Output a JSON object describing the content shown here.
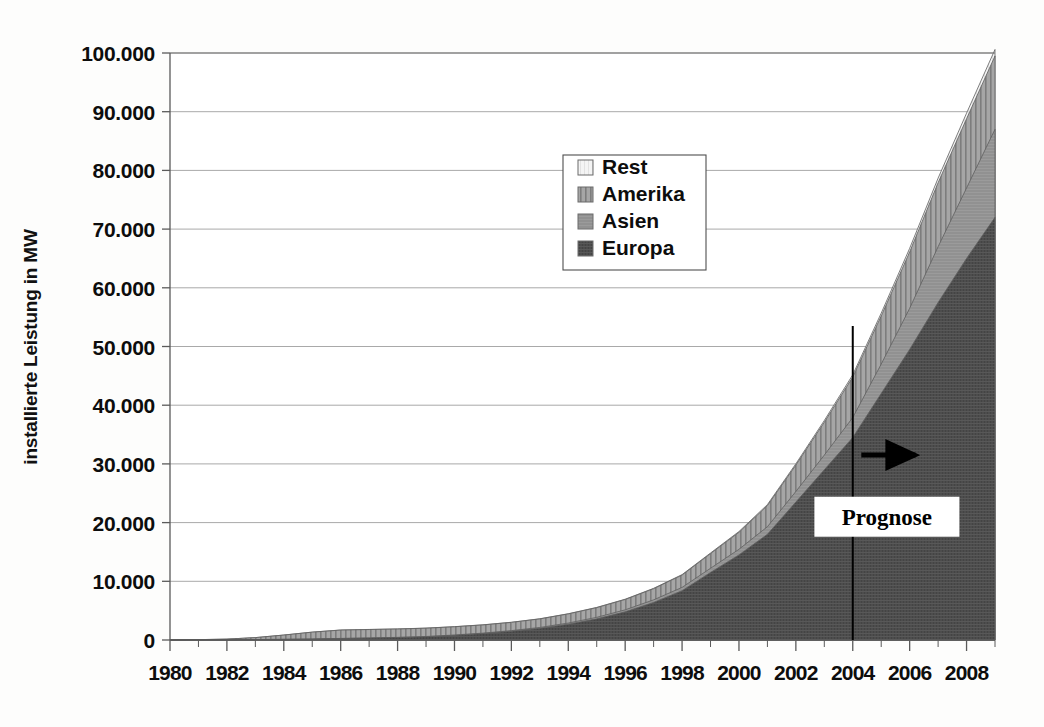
{
  "chart_data": {
    "type": "area",
    "title": "",
    "xlabel": "",
    "ylabel": "installierte Leistung in MW",
    "ylim": [
      0,
      100000
    ],
    "xlim": [
      1980,
      2009
    ],
    "grid": true,
    "stacked": true,
    "legend_position": "inside-top-center",
    "y_ticks": [
      "0",
      "10.000",
      "20.000",
      "30.000",
      "40.000",
      "50.000",
      "60.000",
      "70.000",
      "80.000",
      "90.000",
      "100.000"
    ],
    "y_tick_values": [
      0,
      10000,
      20000,
      30000,
      40000,
      50000,
      60000,
      70000,
      80000,
      90000,
      100000
    ],
    "x_ticks": [
      "1980",
      "1982",
      "1984",
      "1986",
      "1988",
      "1990",
      "1992",
      "1994",
      "1996",
      "1998",
      "2000",
      "2002",
      "2004",
      "2006",
      "2008"
    ],
    "x_tick_values": [
      1980,
      1982,
      1984,
      1986,
      1988,
      1990,
      1992,
      1994,
      1996,
      1998,
      2000,
      2002,
      2004,
      2006,
      2008
    ],
    "x": [
      1980,
      1981,
      1982,
      1983,
      1984,
      1985,
      1986,
      1987,
      1988,
      1989,
      1990,
      1991,
      1992,
      1993,
      1994,
      1995,
      1996,
      1997,
      1998,
      1999,
      2000,
      2001,
      2002,
      2003,
      2004,
      2005,
      2006,
      2007,
      2008,
      2009
    ],
    "series": [
      {
        "name": "Europa",
        "color": "#4a4a4a",
        "pattern": "solid-dark",
        "values": [
          10,
          20,
          40,
          70,
          110,
          170,
          250,
          330,
          420,
          560,
          800,
          1100,
          1500,
          2000,
          2700,
          3600,
          4800,
          6400,
          8400,
          11500,
          14500,
          18000,
          23500,
          29000,
          34500,
          42000,
          49500,
          57500,
          65000,
          72000
        ]
      },
      {
        "name": "Asien",
        "color": "#8f8f8f",
        "pattern": "solid-mid",
        "values": [
          0,
          0,
          0,
          5,
          10,
          15,
          20,
          25,
          30,
          40,
          55,
          75,
          100,
          140,
          190,
          260,
          340,
          440,
          560,
          720,
          950,
          1300,
          1800,
          2500,
          3400,
          5000,
          7000,
          9500,
          12000,
          15000
        ]
      },
      {
        "name": "Amerika",
        "color": "#9a9a9a",
        "pattern": "striped",
        "values": [
          15,
          40,
          110,
          330,
          720,
          1150,
          1420,
          1430,
          1420,
          1410,
          1400,
          1390,
          1400,
          1450,
          1550,
          1650,
          1760,
          1900,
          2100,
          2500,
          2900,
          3600,
          4500,
          5600,
          6900,
          8200,
          9600,
          10900,
          11800,
          12500
        ]
      },
      {
        "name": "Rest",
        "color": "#f2f2f2",
        "pattern": "light",
        "values": [
          0,
          0,
          0,
          0,
          5,
          10,
          12,
          14,
          15,
          16,
          18,
          20,
          22,
          26,
          32,
          40,
          50,
          62,
          78,
          100,
          130,
          170,
          220,
          290,
          380,
          480,
          620,
          780,
          950,
          1100
        ]
      }
    ],
    "annotations": [
      {
        "name": "prognose-divider",
        "type": "vline",
        "x": 2004,
        "y_top": 53500,
        "y_bottom": 0
      },
      {
        "name": "prognose-arrow",
        "type": "arrow",
        "label": "",
        "x_start": 2004.3,
        "x_end": 2006.2,
        "y": 31500
      },
      {
        "name": "prognose-label",
        "type": "text-box",
        "label": "Prognose",
        "x": 2005.2,
        "y": 21000
      }
    ]
  },
  "legend": {
    "items": [
      {
        "label": "Rest",
        "swatch": "light"
      },
      {
        "label": "Amerika",
        "swatch": "striped"
      },
      {
        "label": "Asien",
        "swatch": "mid"
      },
      {
        "label": "Europa",
        "swatch": "dark"
      }
    ]
  },
  "colors": {
    "europa": "#4a4a4a",
    "asien": "#8f8f8f",
    "amerika": "#9a9a9a",
    "rest": "#f2f2f2",
    "grid": "#a9a9a9",
    "axis": "#5a5a5a",
    "text": "#0d0d0d",
    "background": "#fdfdfc"
  }
}
